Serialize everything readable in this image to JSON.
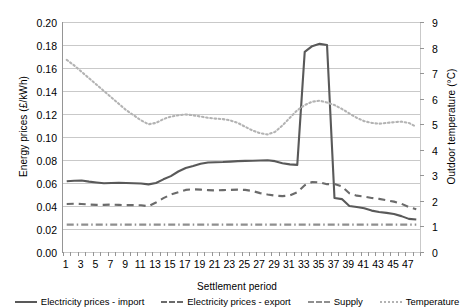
{
  "chart_data": {
    "type": "line",
    "title": "",
    "xlabel": "Settlement period",
    "ylabel": "Energy prices (£/kWh)",
    "y2label": "Outdoor temperature (°C)",
    "grid": true,
    "legend_position": "bottom",
    "xlim": [
      1,
      48
    ],
    "ylim": [
      0.0,
      0.2
    ],
    "y2lim": [
      0,
      9
    ],
    "yticks": [
      "0.00",
      "0.02",
      "0.04",
      "0.06",
      "0.08",
      "0.10",
      "0.12",
      "0.14",
      "0.16",
      "0.18",
      "0.20"
    ],
    "y2ticks": [
      "0",
      "1",
      "2",
      "3",
      "4",
      "5",
      "6",
      "7",
      "8",
      "9"
    ],
    "xticks": [
      "1",
      "3",
      "5",
      "7",
      "9",
      "11",
      "13",
      "15",
      "17",
      "19",
      "21",
      "23",
      "25",
      "27",
      "29",
      "31",
      "33",
      "35",
      "37",
      "39",
      "41",
      "43",
      "45",
      "47"
    ],
    "x": [
      1,
      2,
      3,
      4,
      5,
      6,
      7,
      8,
      9,
      10,
      11,
      12,
      13,
      14,
      15,
      16,
      17,
      18,
      19,
      20,
      21,
      22,
      23,
      24,
      25,
      26,
      27,
      28,
      29,
      30,
      31,
      32,
      33,
      34,
      35,
      36,
      37,
      38,
      39,
      40,
      41,
      42,
      43,
      44,
      45,
      46,
      47,
      48
    ],
    "series": [
      {
        "name": "Electricity prices - import",
        "axis": "left",
        "style": "solid",
        "color": "#595959",
        "values": [
          0.0615,
          0.062,
          0.0622,
          0.0612,
          0.0605,
          0.0598,
          0.06,
          0.0602,
          0.06,
          0.0598,
          0.0596,
          0.0588,
          0.06,
          0.0632,
          0.066,
          0.07,
          0.073,
          0.0748,
          0.0768,
          0.0778,
          0.078,
          0.0782,
          0.0786,
          0.079,
          0.0792,
          0.0794,
          0.0796,
          0.0798,
          0.079,
          0.0772,
          0.0762,
          0.0758,
          0.174,
          0.179,
          0.181,
          0.18,
          0.047,
          0.046,
          0.04,
          0.0392,
          0.038,
          0.036,
          0.0348,
          0.034,
          0.033,
          0.0312,
          0.0288,
          0.0282
        ]
      },
      {
        "name": "Electricity prices - export",
        "axis": "left",
        "style": "dashed",
        "color": "#6b6b6b",
        "values": [
          0.0418,
          0.042,
          0.0418,
          0.0412,
          0.041,
          0.041,
          0.0412,
          0.041,
          0.0408,
          0.0408,
          0.0406,
          0.0398,
          0.043,
          0.0468,
          0.05,
          0.052,
          0.054,
          0.0545,
          0.0542,
          0.0538,
          0.0535,
          0.0538,
          0.054,
          0.0542,
          0.054,
          0.053,
          0.0512,
          0.05,
          0.049,
          0.0486,
          0.0492,
          0.052,
          0.058,
          0.0608,
          0.0605,
          0.059,
          0.0592,
          0.057,
          0.051,
          0.049,
          0.0482,
          0.047,
          0.0462,
          0.045,
          0.0438,
          0.042,
          0.039,
          0.0372
        ]
      },
      {
        "name": "Supply",
        "axis": "left",
        "style": "dashdot",
        "color": "#8f8f8f",
        "values": [
          0.0238,
          0.0238,
          0.0238,
          0.0238,
          0.0238,
          0.0238,
          0.0238,
          0.0238,
          0.0238,
          0.0238,
          0.0238,
          0.0238,
          0.0238,
          0.0238,
          0.0238,
          0.0238,
          0.0238,
          0.0238,
          0.0238,
          0.0238,
          0.0238,
          0.0238,
          0.0238,
          0.0238,
          0.0238,
          0.0238,
          0.0238,
          0.0238,
          0.0238,
          0.0238,
          0.0238,
          0.0238,
          0.0238,
          0.0238,
          0.0238,
          0.0238,
          0.0238,
          0.0238,
          0.0238,
          0.0238,
          0.0238,
          0.0238,
          0.0238,
          0.0238,
          0.0238,
          0.0238,
          0.0238,
          0.0238
        ]
      },
      {
        "name": "Temperature",
        "axis": "right",
        "style": "dotted",
        "color": "#b3b3b3",
        "values": [
          7.52,
          7.3,
          7.05,
          6.8,
          6.55,
          6.3,
          6.05,
          5.8,
          5.55,
          5.35,
          5.15,
          5.0,
          5.05,
          5.2,
          5.3,
          5.35,
          5.38,
          5.35,
          5.3,
          5.25,
          5.22,
          5.2,
          5.15,
          5.05,
          4.9,
          4.75,
          4.65,
          4.6,
          4.7,
          4.95,
          5.25,
          5.55,
          5.75,
          5.88,
          5.92,
          5.85,
          5.75,
          5.6,
          5.42,
          5.25,
          5.12,
          5.05,
          5.02,
          5.05,
          5.08,
          5.1,
          5.05,
          4.9
        ]
      }
    ]
  }
}
